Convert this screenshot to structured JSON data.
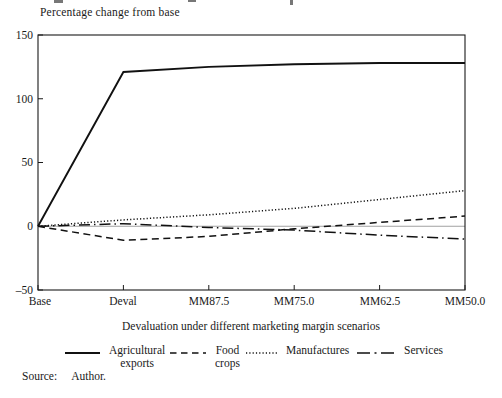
{
  "figure": {
    "axis_title_top": "Percentage change from base",
    "x_axis_title": "Devaluation under different marketing margin scenarios",
    "source_label": "Source:",
    "source_value": "Author."
  },
  "chart_data": {
    "type": "line",
    "title": "Percentage change from base",
    "xlabel": "Devaluation under different marketing margin scenarios",
    "categories": [
      "Base",
      "Deval",
      "MM87.5",
      "MM75.0",
      "MM62.5",
      "MM50.0"
    ],
    "ytick_labels": [
      "150",
      "100",
      "50",
      "0",
      "–50"
    ],
    "yticks": [
      150,
      100,
      50,
      0,
      -50
    ],
    "ylim": [
      -50,
      150
    ],
    "grid": false,
    "zero_line": true,
    "legend_position": "bottom",
    "line_color": "#111111",
    "series": [
      {
        "name": "Agricultural exports",
        "style": "solid",
        "values": [
          0,
          121,
          125,
          127,
          128,
          128
        ]
      },
      {
        "name": "Food crops",
        "style": "dashed",
        "values": [
          0,
          -11,
          -8,
          -2,
          3,
          8
        ]
      },
      {
        "name": "Manufactures",
        "style": "dotted",
        "values": [
          0,
          5,
          9,
          14,
          21,
          28
        ]
      },
      {
        "name": "Services",
        "style": "dashdot",
        "values": [
          0,
          2,
          -1,
          -3,
          -7,
          -10
        ]
      }
    ],
    "legend": [
      {
        "line1": "Agricultural",
        "line2": "exports",
        "style": "solid"
      },
      {
        "line1": "Food",
        "line2": "crops",
        "style": "dashed"
      },
      {
        "line1": "Manufactures",
        "line2": "",
        "style": "dotted"
      },
      {
        "line1": "Services",
        "line2": "",
        "style": "dashdot"
      }
    ],
    "source": "Source: Author."
  }
}
